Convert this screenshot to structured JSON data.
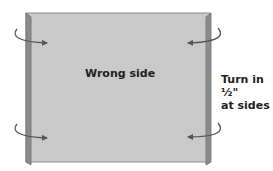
{
  "diagram": {
    "panel_label": "Wrong side",
    "side_note_line1": "Turn in ½\"",
    "side_note_line2": "at sides",
    "colors": {
      "panel_fill": "#c9c9c9",
      "fold_strip": "#8c8c8c",
      "outline": "#6e6e6e",
      "arrow": "#555555"
    },
    "arrows": [
      {
        "position": "top-left",
        "direction": "right"
      },
      {
        "position": "top-right",
        "direction": "left"
      },
      {
        "position": "bottom-left",
        "direction": "right"
      },
      {
        "position": "bottom-right",
        "direction": "left"
      }
    ]
  }
}
